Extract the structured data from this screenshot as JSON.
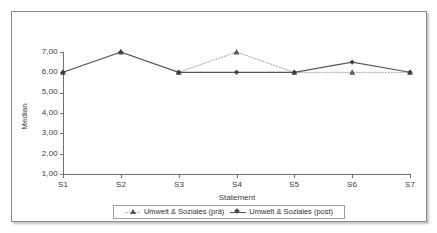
{
  "chart_data": {
    "type": "line",
    "title": "",
    "xlabel": "Statement",
    "ylabel": "Median",
    "categories": [
      "S1",
      "S2",
      "S3",
      "S4",
      "S5",
      "S6",
      "S7"
    ],
    "ylim": [
      1.0,
      7.0
    ],
    "ytick_labels": [
      "7,00",
      "6,00",
      "5,00",
      "4,00",
      "3,00",
      "2,00",
      "1,00"
    ],
    "ytick_values": [
      7.0,
      6.0,
      5.0,
      4.0,
      3.0,
      2.0,
      1.0
    ],
    "grid": false,
    "legend_position": "bottom",
    "series": [
      {
        "name": "Umwelt & Soziales (prä)",
        "marker": "triangle",
        "line_style": "dotted",
        "color": "#a8a8a8",
        "values": [
          6.0,
          7.0,
          6.0,
          7.0,
          6.0,
          6.0,
          6.0
        ]
      },
      {
        "name": "Umwelt & Soziales (post)",
        "marker": "diamond",
        "line_style": "solid",
        "color": "#575757",
        "values": [
          6.0,
          7.0,
          6.0,
          6.0,
          6.0,
          6.5,
          6.0
        ]
      }
    ]
  },
  "legend": {
    "entries": [
      {
        "label": "Umwelt & Soziales (prä)"
      },
      {
        "label": "Umwelt & Soziales (post)"
      }
    ]
  }
}
